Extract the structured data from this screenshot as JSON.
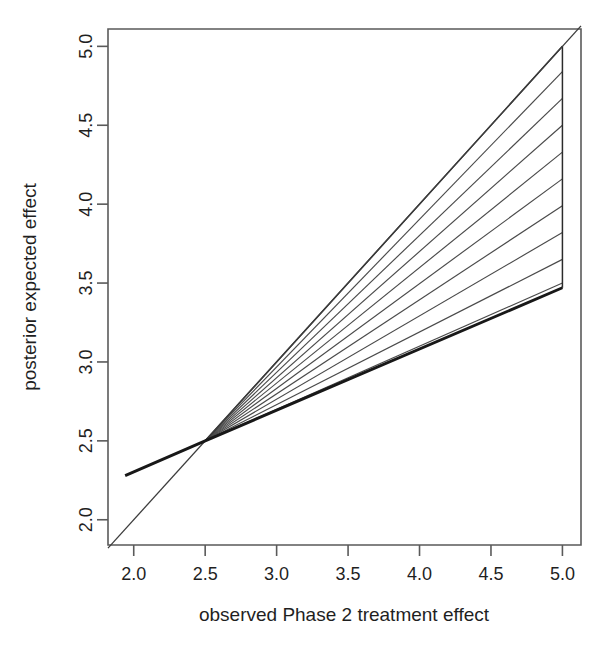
{
  "chart_data": {
    "type": "line",
    "title": "",
    "xlabel": "observed Phase 2 treatment effect",
    "ylabel": "posterior expected effect",
    "xlim": [
      1.82,
      5.13
    ],
    "ylim": [
      1.84,
      5.11
    ],
    "xticks": [
      2.0,
      2.5,
      3.0,
      3.5,
      4.0,
      4.5,
      5.0
    ],
    "yticks": [
      2.0,
      2.5,
      3.0,
      3.5,
      4.0,
      4.5,
      5.0
    ],
    "xtick_labels": [
      "2.0",
      "2.5",
      "3.0",
      "3.5",
      "4.0",
      "4.5",
      "5.0"
    ],
    "ytick_labels": [
      "2.0",
      "2.5",
      "3.0",
      "3.5",
      "4.0",
      "4.5",
      "5.0"
    ],
    "grid": false,
    "legend": "none",
    "series": [
      {
        "name": "identity-line",
        "style": "thin",
        "x": [
          1.82,
          5.13
        ],
        "values": [
          1.82,
          5.13
        ]
      },
      {
        "name": "shrinkage-line",
        "style": "thick",
        "x": [
          1.94,
          2.5,
          5.0
        ],
        "values": [
          2.28,
          2.5,
          3.47
        ]
      }
    ],
    "shaded_region": {
      "name": "hatched-wedge",
      "fill": "diagonal-hatch",
      "vertices_x": [
        2.5,
        5.0,
        5.0
      ],
      "vertices_y": [
        2.5,
        5.0,
        3.47
      ],
      "hatch_count": 9,
      "hatch_right_edge_y": [
        4.84,
        4.67,
        4.5,
        4.33,
        4.16,
        3.99,
        3.82,
        3.65,
        3.5
      ]
    },
    "colors": {
      "axis": "#5a5a5a",
      "identity_line": "#3d3d3d",
      "shrinkage_line": "#181818",
      "hatch": "#4a4a4a",
      "background": "#ffffff",
      "text": "#1f1f1f"
    }
  },
  "axes": {
    "x_title": "observed Phase 2 treatment effect",
    "y_title": "posterior expected effect"
  }
}
